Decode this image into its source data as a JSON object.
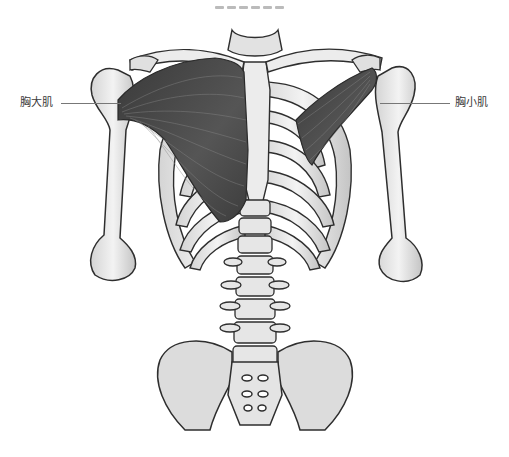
{
  "diagram": {
    "title_visible": false,
    "labels": [
      {
        "id": "pectoralis-major",
        "text": "胸大肌",
        "side": "left"
      },
      {
        "id": "pectoralis-minor",
        "text": "胸小肌",
        "side": "right"
      }
    ],
    "colors": {
      "bone_fill": "#ececec",
      "bone_shade": "#c8c8c8",
      "bone_outline": "#2e2e2e",
      "muscle_fill": "#4a4a4a",
      "muscle_fiber": "#8a8a8a",
      "leader_line": "#777777",
      "label_text": "#3a3a3a"
    }
  }
}
